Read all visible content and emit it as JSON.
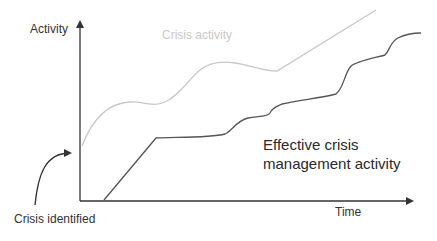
{
  "diagram": {
    "y_axis_label": "Activity",
    "x_axis_label": "Time",
    "annotation_arrow_label": "Crisis identified",
    "series": [
      {
        "name": "Crisis activity",
        "label": "Crisis activity",
        "color": "#c8c8c8",
        "description": "wavy curve starting above the origin, rising with two humps, dipping around the midpoint, then climbing straight to the top right"
      },
      {
        "name": "Effective crisis management activity",
        "label": "Effective crisis management activity",
        "color": "#555555",
        "description": "starts on the time axis after a delay, rises steeply, plateaus, then increases in a series of steps toward the top right"
      }
    ],
    "colors": {
      "axis": "#333333",
      "crisis_line": "#c8c8c8",
      "management_line": "#555555",
      "background": "#ffffff"
    }
  }
}
